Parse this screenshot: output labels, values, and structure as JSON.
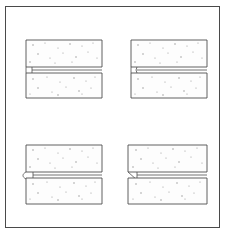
{
  "figure": {
    "title": "Concrete block joint edge profiles",
    "frame": {
      "x": 5,
      "y": 6,
      "width": 215,
      "height": 222,
      "stroke_color": "#4a4a4a",
      "background_color": "#ffffff"
    },
    "style": {
      "line_color": "#4f4f4f",
      "fill_color": "#fdfdfd",
      "speckle_color": "#9a9a9a",
      "line_width": 0.9
    },
    "details": [
      {
        "id": "detail-top-left",
        "name": "square-butt-joint",
        "position": "top-left",
        "edge_profile": "square",
        "upper_block": {
          "x": 26,
          "y": 40,
          "width": 76,
          "height": 27
        },
        "lower_block": {
          "x": 26,
          "y": 73,
          "width": 76,
          "height": 25
        },
        "joint_gap": {
          "top": 67,
          "bottom": 73,
          "left": 26,
          "right": 102
        },
        "notch_width": 6,
        "speckle_count": 26
      },
      {
        "id": "detail-top-right",
        "name": "stepped-notch-joint",
        "position": "top-right",
        "edge_profile": "stepped",
        "upper_block": {
          "x": 131,
          "y": 40,
          "width": 76,
          "height": 27
        },
        "lower_block": {
          "x": 131,
          "y": 73,
          "width": 76,
          "height": 25
        },
        "joint_gap": {
          "top": 67,
          "bottom": 73,
          "left": 131,
          "right": 207
        },
        "notch_width": 6,
        "speckle_count": 26
      },
      {
        "id": "detail-bottom-left",
        "name": "rounded-notch-joint",
        "position": "bottom-left",
        "edge_profile": "rounded",
        "upper_block": {
          "x": 26,
          "y": 145,
          "width": 76,
          "height": 27
        },
        "lower_block": {
          "x": 26,
          "y": 178,
          "width": 76,
          "height": 26
        },
        "joint_gap": {
          "top": 172,
          "bottom": 178,
          "left": 26,
          "right": 102
        },
        "notch_width": 7,
        "speckle_count": 26
      },
      {
        "id": "detail-bottom-right",
        "name": "chamfered-notch-joint",
        "position": "bottom-right",
        "edge_profile": "chamfered",
        "upper_block": {
          "x": 128,
          "y": 145,
          "width": 79,
          "height": 27
        },
        "lower_block": {
          "x": 128,
          "y": 178,
          "width": 79,
          "height": 26
        },
        "joint_gap": {
          "top": 172,
          "bottom": 178,
          "left": 128,
          "right": 207
        },
        "notch_width": 9,
        "speckle_count": 26
      }
    ],
    "speckles": {
      "detail-top-left": {
        "upper": [
          [
            33,
            45
          ],
          [
            45,
            43
          ],
          [
            58,
            48
          ],
          [
            70,
            44
          ],
          [
            82,
            46
          ],
          [
            93,
            43
          ],
          [
            38,
            54
          ],
          [
            50,
            58
          ],
          [
            63,
            53
          ],
          [
            76,
            57
          ],
          [
            88,
            52
          ],
          [
            97,
            58
          ],
          [
            30,
            62
          ],
          [
            55,
            63
          ],
          [
            72,
            62
          ]
        ],
        "lower": [
          [
            33,
            79
          ],
          [
            47,
            77
          ],
          [
            60,
            82
          ],
          [
            74,
            78
          ],
          [
            86,
            81
          ],
          [
            95,
            77
          ],
          [
            38,
            88
          ],
          [
            52,
            92
          ],
          [
            66,
            87
          ],
          [
            79,
            91
          ],
          [
            91,
            88
          ],
          [
            30,
            94
          ],
          [
            58,
            95
          ],
          [
            82,
            94
          ]
        ]
      },
      "detail-top-right": {
        "upper": [
          [
            138,
            45
          ],
          [
            150,
            43
          ],
          [
            163,
            48
          ],
          [
            175,
            44
          ],
          [
            187,
            46
          ],
          [
            198,
            43
          ],
          [
            143,
            54
          ],
          [
            155,
            58
          ],
          [
            168,
            53
          ],
          [
            181,
            57
          ],
          [
            193,
            52
          ],
          [
            202,
            58
          ],
          [
            135,
            62
          ],
          [
            160,
            63
          ],
          [
            177,
            62
          ]
        ],
        "lower": [
          [
            138,
            79
          ],
          [
            152,
            77
          ],
          [
            165,
            82
          ],
          [
            179,
            78
          ],
          [
            191,
            81
          ],
          [
            200,
            77
          ],
          [
            143,
            88
          ],
          [
            157,
            92
          ],
          [
            171,
            87
          ],
          [
            184,
            91
          ],
          [
            196,
            88
          ],
          [
            135,
            94
          ],
          [
            163,
            95
          ],
          [
            187,
            94
          ]
        ]
      },
      "detail-bottom-left": {
        "upper": [
          [
            33,
            150
          ],
          [
            45,
            148
          ],
          [
            58,
            153
          ],
          [
            70,
            149
          ],
          [
            82,
            151
          ],
          [
            93,
            148
          ],
          [
            38,
            159
          ],
          [
            50,
            163
          ],
          [
            63,
            158
          ],
          [
            76,
            162
          ],
          [
            88,
            157
          ],
          [
            97,
            163
          ],
          [
            30,
            167
          ],
          [
            55,
            168
          ],
          [
            72,
            167
          ]
        ],
        "lower": [
          [
            33,
            184
          ],
          [
            47,
            182
          ],
          [
            60,
            187
          ],
          [
            74,
            183
          ],
          [
            86,
            186
          ],
          [
            95,
            182
          ],
          [
            38,
            193
          ],
          [
            52,
            197
          ],
          [
            66,
            192
          ],
          [
            79,
            196
          ],
          [
            91,
            193
          ],
          [
            30,
            199
          ],
          [
            58,
            200
          ],
          [
            82,
            199
          ]
        ]
      },
      "detail-bottom-right": {
        "upper": [
          [
            136,
            150
          ],
          [
            148,
            148
          ],
          [
            161,
            153
          ],
          [
            173,
            149
          ],
          [
            185,
            151
          ],
          [
            197,
            148
          ],
          [
            141,
            159
          ],
          [
            153,
            163
          ],
          [
            166,
            158
          ],
          [
            179,
            162
          ],
          [
            191,
            157
          ],
          [
            202,
            163
          ],
          [
            133,
            167
          ],
          [
            158,
            168
          ],
          [
            175,
            167
          ]
        ],
        "lower": [
          [
            136,
            184
          ],
          [
            150,
            182
          ],
          [
            163,
            187
          ],
          [
            177,
            183
          ],
          [
            189,
            186
          ],
          [
            200,
            182
          ],
          [
            141,
            193
          ],
          [
            155,
            197
          ],
          [
            169,
            192
          ],
          [
            182,
            196
          ],
          [
            194,
            193
          ],
          [
            133,
            199
          ],
          [
            161,
            200
          ],
          [
            185,
            199
          ]
        ]
      }
    }
  }
}
